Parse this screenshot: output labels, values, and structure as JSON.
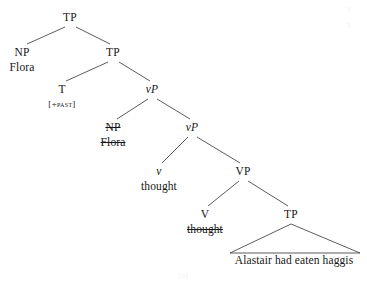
{
  "diagram": {
    "type": "syntax-tree",
    "title": "",
    "canvas": {
      "width": 367,
      "height": 283
    },
    "nodes": [
      {
        "id": "tp-root",
        "label": "TP",
        "x": 70,
        "y": 12,
        "italic_head": false,
        "word": null,
        "word_struck": false,
        "feature": null
      },
      {
        "id": "np-subject",
        "label": "NP",
        "x": 22,
        "y": 47,
        "italic_head": false,
        "word": "Flora",
        "word_struck": false,
        "feature": null
      },
      {
        "id": "tp-bar",
        "label": "TP",
        "x": 113,
        "y": 47,
        "italic_head": false,
        "word": null,
        "word_struck": false,
        "feature": null
      },
      {
        "id": "t-head",
        "label": "T",
        "x": 62,
        "y": 84,
        "italic_head": false,
        "word": null,
        "word_struck": false,
        "feature": "[+past]"
      },
      {
        "id": "vp-little-up",
        "label": "vP",
        "x": 152,
        "y": 84,
        "italic_head": true,
        "word": null,
        "word_struck": false,
        "feature": null
      },
      {
        "id": "np-trace",
        "label": "NP",
        "x": 113,
        "y": 122,
        "italic_head": false,
        "word": "Flora",
        "word_struck": true,
        "feature": null,
        "label_struck": true
      },
      {
        "id": "vp-little-lo",
        "label": "vP",
        "x": 192,
        "y": 122,
        "italic_head": true,
        "word": null,
        "word_struck": false,
        "feature": null
      },
      {
        "id": "v-little",
        "label": "v",
        "x": 159,
        "y": 166,
        "italic_head": true,
        "word": "thought",
        "word_struck": false,
        "feature": null
      },
      {
        "id": "vp-big",
        "label": "VP",
        "x": 243,
        "y": 166,
        "italic_head": false,
        "word": null,
        "word_struck": false,
        "feature": null
      },
      {
        "id": "v-big",
        "label": "V",
        "x": 205,
        "y": 209,
        "italic_head": false,
        "word": "thought",
        "word_struck": true,
        "feature": null
      },
      {
        "id": "tp-embedded",
        "label": "TP",
        "x": 291,
        "y": 209,
        "italic_head": false,
        "word": null,
        "word_struck": false,
        "feature": null
      }
    ],
    "branches": [
      {
        "from": "tp-root",
        "to": "np-subject",
        "x1": 65,
        "y1": 27,
        "x2": 27,
        "y2": 44
      },
      {
        "from": "tp-root",
        "to": "tp-bar",
        "x1": 76,
        "y1": 27,
        "x2": 110,
        "y2": 44
      },
      {
        "from": "tp-bar",
        "to": "t-head",
        "x1": 108,
        "y1": 62,
        "x2": 66,
        "y2": 81
      },
      {
        "from": "tp-bar",
        "to": "vp-little-up",
        "x1": 119,
        "y1": 62,
        "x2": 150,
        "y2": 81
      },
      {
        "from": "vp-little-up",
        "to": "np-trace",
        "x1": 148,
        "y1": 99,
        "x2": 117,
        "y2": 119
      },
      {
        "from": "vp-little-up",
        "to": "vp-little-lo",
        "x1": 157,
        "y1": 99,
        "x2": 190,
        "y2": 119
      },
      {
        "from": "vp-little-lo",
        "to": "v-little",
        "x1": 188,
        "y1": 137,
        "x2": 162,
        "y2": 163
      },
      {
        "from": "vp-little-lo",
        "to": "vp-big",
        "x1": 197,
        "y1": 137,
        "x2": 240,
        "y2": 163
      },
      {
        "from": "vp-big",
        "to": "v-big",
        "x1": 239,
        "y1": 181,
        "x2": 208,
        "y2": 206
      },
      {
        "from": "vp-big",
        "to": "tp-embedded",
        "x1": 248,
        "y1": 181,
        "x2": 288,
        "y2": 206
      }
    ],
    "triangles": [
      {
        "id": "embedded-clause-triangle",
        "parent": "tp-embedded",
        "apex_x": 291,
        "apex_y": 224,
        "left_x": 230,
        "right_x": 360,
        "base_y": 253,
        "text": "Alastair had eaten haggis",
        "text_x": 294,
        "text_y": 254
      }
    ],
    "artifacts": [
      {
        "id": "corner-mark-1",
        "text": "y",
        "x": 347,
        "y": 4
      },
      {
        "id": "corner-mark-2",
        "text": "z",
        "x": 347,
        "y": 20
      },
      {
        "id": "footer-page-number",
        "text": "181",
        "x": 183,
        "y": 272
      }
    ]
  }
}
